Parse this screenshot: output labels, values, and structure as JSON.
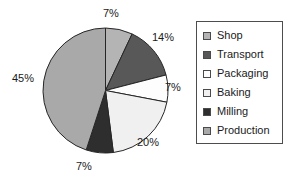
{
  "chart_data": {
    "type": "pie",
    "title": "",
    "subtitle": "",
    "xlabel": "",
    "ylabel": "",
    "grid": false,
    "legend_position": "right",
    "start_angle_deg": 0,
    "direction": "clockwise",
    "categories": [
      "Shop",
      "Transport",
      "Packaging",
      "Baking",
      "Milling",
      "Production"
    ],
    "values": [
      7,
      14,
      7,
      20,
      7,
      45
    ],
    "value_unit": "%",
    "data_labels": [
      "7%",
      "14%",
      "7%",
      "20%",
      "7%",
      "45%"
    ],
    "colors": [
      "#b4b4b4",
      "#585858",
      "#fdfdfd",
      "#f0f0f0",
      "#2e2e2e",
      "#a9a9a9"
    ],
    "slices": [
      {
        "label": "Shop",
        "value": 7,
        "data_label": "7%",
        "color": "#b4b4b4"
      },
      {
        "label": "Transport",
        "value": 14,
        "data_label": "14%",
        "color": "#585858"
      },
      {
        "label": "Packaging",
        "value": 7,
        "data_label": "7%",
        "color": "#fdfdfd"
      },
      {
        "label": "Baking",
        "value": 20,
        "data_label": "20%",
        "color": "#f0f0f0"
      },
      {
        "label": "Milling",
        "value": 7,
        "data_label": "7%",
        "color": "#2e2e2e"
      },
      {
        "label": "Production",
        "value": 45,
        "data_label": "45%",
        "color": "#a9a9a9"
      }
    ]
  },
  "labels": {
    "shop": "7%",
    "transport": "14%",
    "packaging": "7%",
    "baking": "20%",
    "milling": "7%",
    "production": "45%"
  },
  "legend": {
    "items": [
      {
        "label": "Shop",
        "color": "#b4b4b4"
      },
      {
        "label": "Transport",
        "color": "#585858"
      },
      {
        "label": "Packaging",
        "color": "#fdfdfd"
      },
      {
        "label": "Baking",
        "color": "#f0f0f0"
      },
      {
        "label": "Milling",
        "color": "#2e2e2e"
      },
      {
        "label": "Production",
        "color": "#a9a9a9"
      }
    ]
  },
  "style": {
    "slice_outline": "#262626",
    "legend_border": "#4d4d4d",
    "background": "#ffffff"
  }
}
